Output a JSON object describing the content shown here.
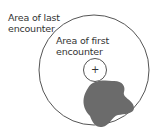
{
  "labels": {
    "outer_line1": "Area of last",
    "outer_line2": "encounter",
    "inner_line1": "Area of first",
    "inner_line2": "encounter",
    "center_mark": "+"
  },
  "colors": {
    "stroke": "#444444",
    "blob": "#6b6b6b"
  }
}
